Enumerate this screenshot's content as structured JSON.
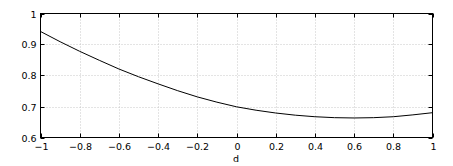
{
  "chart_data": {
    "type": "line",
    "title": "",
    "xlabel": "d",
    "ylabel": "",
    "xlim": [
      -1,
      1
    ],
    "ylim": [
      0.6,
      1.0
    ],
    "grid": true,
    "legend": null,
    "x_ticks": [
      -1,
      -0.8,
      -0.6,
      -0.4,
      -0.2,
      0,
      0.2,
      0.4,
      0.6,
      0.8,
      1
    ],
    "x_tick_labels": [
      "-1",
      "-0.8",
      "-0.6",
      "-0.4",
      "-0.2",
      "0",
      "0.2",
      "0.4",
      "0.6",
      "0.8",
      "1"
    ],
    "y_ticks": [
      0.6,
      0.7,
      0.8,
      0.9,
      1.0
    ],
    "y_tick_labels": [
      "0.6",
      "0.7",
      "0.8",
      "0.9",
      "1"
    ],
    "series": [
      {
        "name": "curve",
        "color": "#000000",
        "x": [
          -1.0,
          -0.9,
          -0.8,
          -0.7,
          -0.6,
          -0.5,
          -0.4,
          -0.3,
          -0.2,
          -0.1,
          0.0,
          0.1,
          0.2,
          0.3,
          0.4,
          0.5,
          0.6,
          0.7,
          0.8,
          0.9,
          1.0
        ],
        "y": [
          0.942,
          0.909,
          0.878,
          0.849,
          0.821,
          0.796,
          0.773,
          0.751,
          0.731,
          0.714,
          0.699,
          0.688,
          0.679,
          0.672,
          0.667,
          0.664,
          0.663,
          0.664,
          0.667,
          0.673,
          0.68
        ]
      }
    ],
    "annotations": {
      "note": "max and min below are computed from a fitted quadratic y ≈ 0.70 - 0.13x + 0.115x^2, not read from the image; the min x location is approximate",
      "max": {
        "x": -1.0,
        "y": 0.9425,
        "source": "fit"
      },
      "min": {
        "x": 0.565,
        "y": 0.6633,
        "source": "fit"
      }
    }
  }
}
